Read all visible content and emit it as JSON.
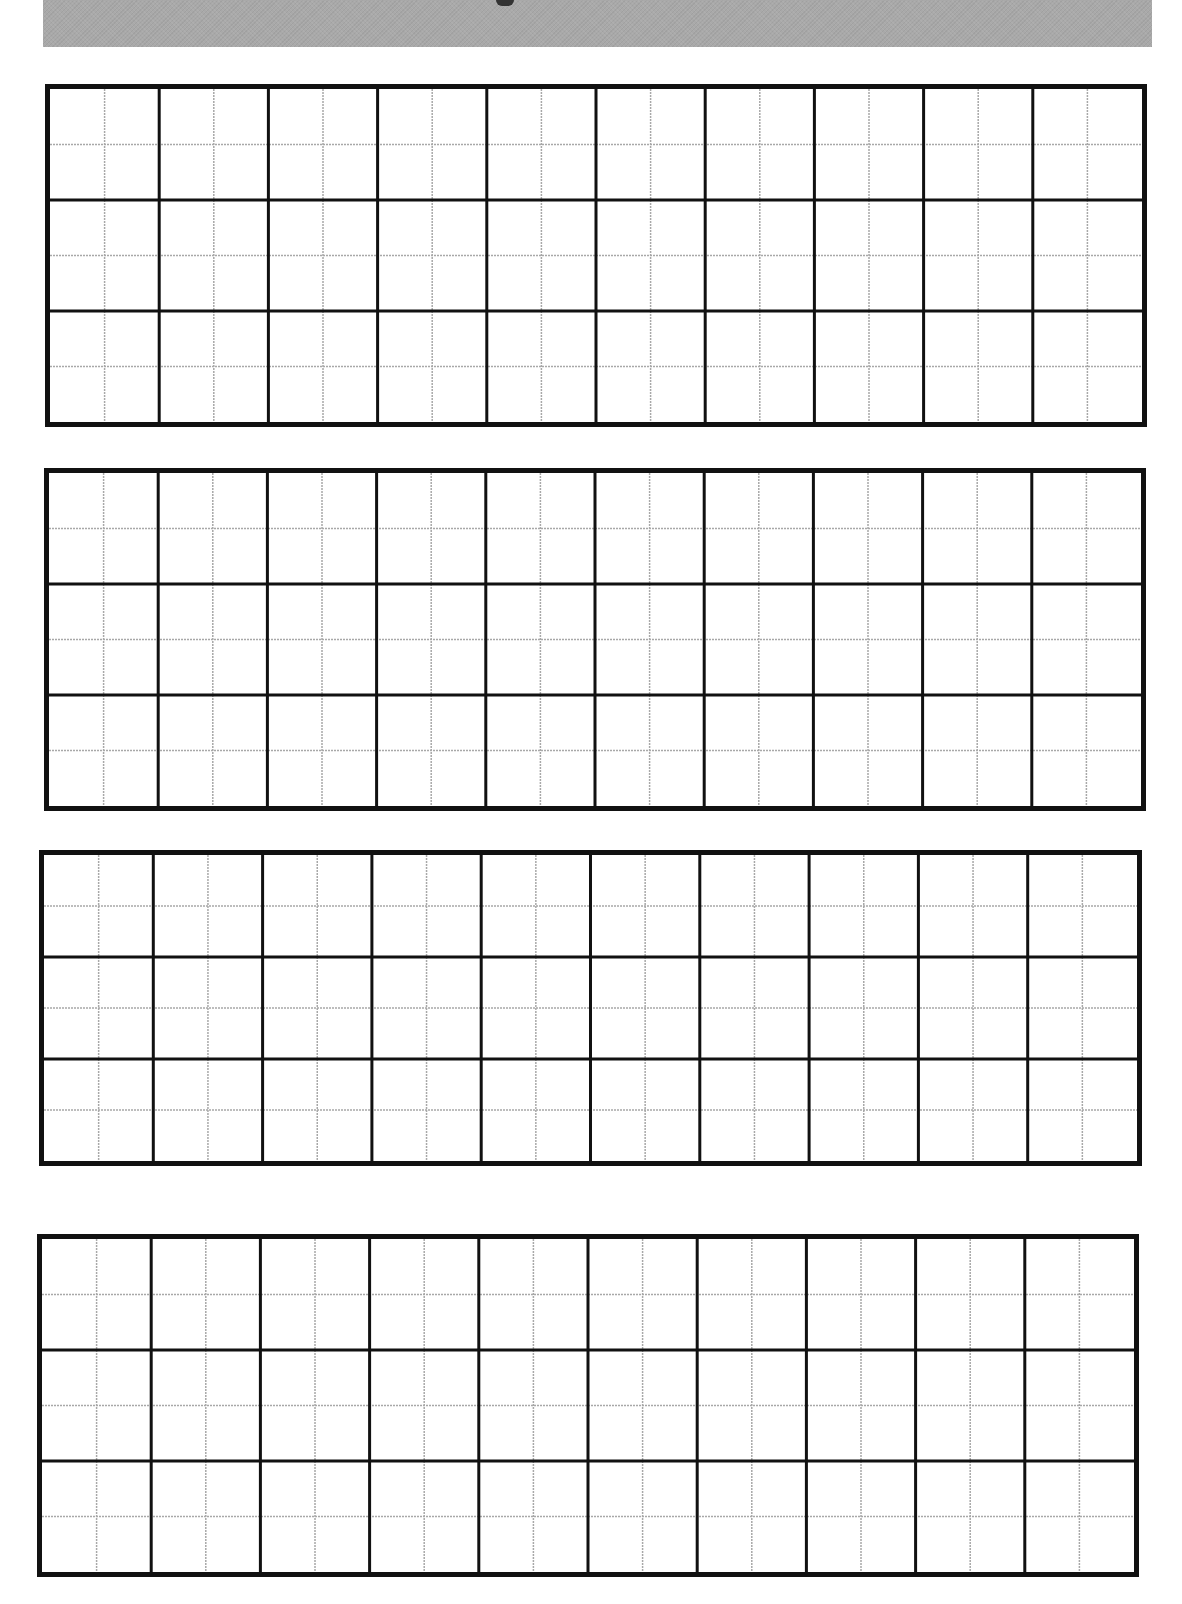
{
  "page": {
    "width": 1182,
    "height": 1604,
    "background": "#ffffff"
  },
  "banner": {
    "color": "#a9a9a9",
    "box": {
      "x": 43,
      "y": 0,
      "w": 1109,
      "h": 47
    },
    "glyph": {
      "x": 496,
      "y": 0
    }
  },
  "grid_style": {
    "major_columns": 10,
    "major_rows": 3,
    "subdivisions": 2,
    "border_color": "#111111",
    "major_line_color": "#111111",
    "minor_line_color": "#a8a8a8",
    "border_width": 5,
    "major_line_width": 3,
    "minor_line_width": 1.5
  },
  "grid_blocks": [
    {
      "id": "grid-block-1",
      "x": 45,
      "y": 84,
      "w": 1102,
      "h": 343
    },
    {
      "id": "grid-block-2",
      "x": 44,
      "y": 468,
      "w": 1102,
      "h": 343
    },
    {
      "id": "grid-block-3",
      "x": 39,
      "y": 850,
      "w": 1103,
      "h": 316
    },
    {
      "id": "grid-block-4",
      "x": 37,
      "y": 1234,
      "w": 1102,
      "h": 343
    }
  ]
}
